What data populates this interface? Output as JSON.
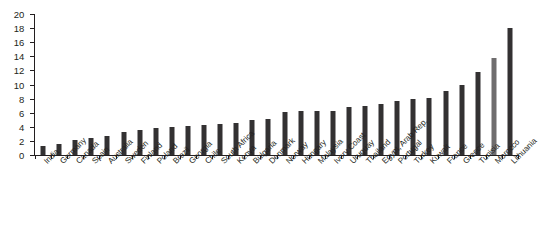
{
  "chart_data": {
    "type": "bar",
    "title": "",
    "subtitle": "",
    "xlabel": "",
    "ylabel": "",
    "ylim": [
      0,
      20
    ],
    "ytick_step": 2,
    "yticks": [
      0,
      2,
      4,
      6,
      8,
      10,
      12,
      14,
      16,
      18,
      20
    ],
    "grid": false,
    "legend": null,
    "bar_color": "#333132",
    "highlight_color": "#6f6d6e",
    "highlight_categories": [
      "Morocco"
    ],
    "categories": [
      "India",
      "Germany",
      "Canada",
      "Spain",
      "Australia",
      "Sweden",
      "Finland",
      "Poland",
      "Brazil",
      "Georgia",
      "Chile",
      "South Africa",
      "Kenya",
      "Bulgaria",
      "Denmark",
      "Norway",
      "Hungary",
      "Malaysia",
      "Ivory Coast",
      "Uruguay",
      "Thailand",
      "Egypt, Arab Rep.",
      "Portugal",
      "Turkey",
      "Kuwait",
      "France",
      "Greece",
      "Tunisia",
      "Morocco",
      "Lithuania"
    ],
    "values": [
      1.3,
      1.6,
      2.1,
      2.4,
      2.7,
      3.2,
      3.6,
      3.8,
      4.0,
      4.1,
      4.3,
      4.4,
      4.6,
      5.0,
      5.1,
      6.1,
      6.2,
      6.2,
      6.3,
      6.8,
      7.0,
      7.3,
      7.7,
      8.0,
      8.1,
      9.1,
      10.0,
      11.8,
      13.8,
      18.0
    ]
  }
}
